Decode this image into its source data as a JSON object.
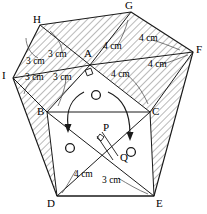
{
  "diagram": {
    "type": "geometric-net",
    "canvas": {
      "width": 207,
      "height": 214
    },
    "stroke_color": "#1a1a1a",
    "hatch_color": "#555555",
    "background": "#ffffff",
    "vertices": [
      {
        "id": "A",
        "label": "A",
        "x": 90,
        "y": 65,
        "lx": 84,
        "ly": 53
      },
      {
        "id": "B",
        "label": "B",
        "x": 47,
        "y": 112,
        "lx": 38,
        "ly": 112
      },
      {
        "id": "C",
        "label": "C",
        "x": 150,
        "y": 112,
        "lx": 152,
        "ly": 112
      },
      {
        "id": "D",
        "label": "D",
        "x": 57,
        "y": 196,
        "lx": 48,
        "ly": 199
      },
      {
        "id": "E",
        "label": "E",
        "x": 154,
        "y": 196,
        "lx": 157,
        "ly": 199
      },
      {
        "id": "F",
        "label": "F",
        "x": 193,
        "y": 52,
        "lx": 196,
        "ly": 48
      },
      {
        "id": "G",
        "label": "G",
        "x": 131,
        "y": 12,
        "lx": 126,
        "ly": 1
      },
      {
        "id": "H",
        "label": "H",
        "x": 40,
        "y": 25,
        "lx": 34,
        "ly": 15
      },
      {
        "id": "I",
        "label": "I",
        "x": 13,
        "y": 78,
        "lx": 3,
        "ly": 74
      },
      {
        "id": "P",
        "label": "P",
        "x": 102,
        "y": 132,
        "lx": 104,
        "ly": 124
      },
      {
        "id": "Q",
        "label": "Q",
        "x": 118,
        "y": 156,
        "lx": 121,
        "ly": 157
      }
    ],
    "dimension_labels": [
      {
        "id": "d1",
        "text": "3 cm",
        "x": 26,
        "y": 61,
        "region": "upper-left"
      },
      {
        "id": "d2",
        "text": "3 cm",
        "x": 48,
        "y": 55,
        "region": "upper-left"
      },
      {
        "id": "d3",
        "text": "3 cm",
        "x": 27,
        "y": 77,
        "region": "lower-left"
      },
      {
        "id": "d4",
        "text": "3 cm",
        "x": 55,
        "y": 77,
        "region": "lower-left"
      },
      {
        "id": "d5",
        "text": "4 cm",
        "x": 105,
        "y": 48,
        "region": "upper-right"
      },
      {
        "id": "d6",
        "text": "4 cm",
        "x": 141,
        "y": 40,
        "region": "upper-right"
      },
      {
        "id": "d7",
        "text": "4 cm",
        "x": 113,
        "y": 74,
        "region": "lower-right"
      },
      {
        "id": "d8",
        "text": "4 cm",
        "x": 150,
        "y": 65,
        "region": "lower-right"
      },
      {
        "id": "d9",
        "text": "4 cm",
        "x": 77,
        "y": 174,
        "region": "bottom-left"
      },
      {
        "id": "d10",
        "text": "3 cm",
        "x": 105,
        "y": 180,
        "region": "bottom-right"
      }
    ],
    "markers": {
      "circles": [
        {
          "id": "c1",
          "x": 96,
          "y": 95,
          "r": 4.5
        },
        {
          "id": "c2",
          "x": 70,
          "y": 148,
          "r": 4.5
        },
        {
          "id": "c3",
          "x": 131,
          "y": 152,
          "r": 4.5
        }
      ],
      "fold_arrows": [
        {
          "id": "a1",
          "from": "A-left",
          "to": "B-down"
        },
        {
          "id": "a2",
          "from": "A-right",
          "to": "C-down"
        }
      ],
      "right_angle_at": "A"
    }
  }
}
